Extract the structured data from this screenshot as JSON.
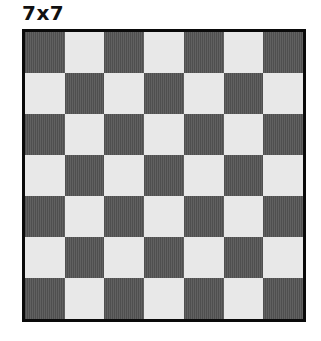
{
  "title": "7x7",
  "board": {
    "rows": 7,
    "cols": 7,
    "top_left_color": "dark",
    "colors": {
      "dark": "#575757",
      "light": "#e8e8e8",
      "border": "#0a0a0a"
    }
  }
}
